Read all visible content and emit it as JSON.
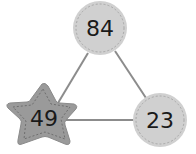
{
  "diagram": {
    "nodes": [
      {
        "id": "top",
        "shape": "circle",
        "value": "84",
        "fill": "#d0d0d0"
      },
      {
        "id": "right",
        "shape": "circle",
        "value": "23",
        "fill": "#d0d0d0"
      },
      {
        "id": "left",
        "shape": "star",
        "value": "49",
        "fill": "#9a9a9a"
      }
    ],
    "edges": [
      {
        "from": "top",
        "to": "left"
      },
      {
        "from": "top",
        "to": "right"
      },
      {
        "from": "left",
        "to": "right"
      }
    ],
    "colors": {
      "edge": "#8c8c8c",
      "stitch": "#a8a8a8",
      "text": "#1a1a1a"
    }
  }
}
